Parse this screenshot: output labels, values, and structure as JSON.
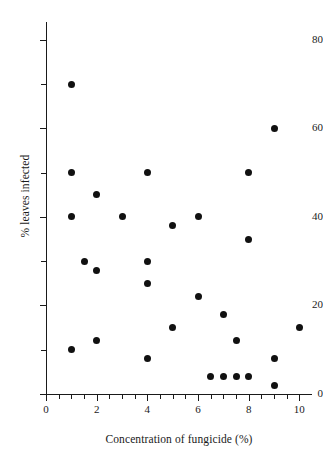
{
  "chart_data": {
    "type": "scatter",
    "title": "",
    "xlabel": "Concentration of fungicide (%)",
    "ylabel": "% leaves infected",
    "xlim": [
      0,
      10.5
    ],
    "ylim": [
      0,
      84
    ],
    "grid": false,
    "legend": null,
    "x_ticks": [
      0,
      2,
      4,
      6,
      8,
      10
    ],
    "x_tick_labels": [
      "0",
      "2",
      "4",
      "6",
      "8",
      "10"
    ],
    "x_minor_tick_step": 0.5,
    "y_ticks": [
      0,
      20,
      40,
      60,
      80
    ],
    "y_tick_labels": [
      "0",
      "20",
      "40",
      "60",
      "80"
    ],
    "y_minor_tick_step": 10,
    "marker": "filled-circle",
    "marker_color": "#111111",
    "axis_color": "#1a1a1a",
    "background_color": "#ffffff",
    "points": [
      {
        "x": 1,
        "y": 70
      },
      {
        "x": 1,
        "y": 50
      },
      {
        "x": 1,
        "y": 40
      },
      {
        "x": 1,
        "y": 10
      },
      {
        "x": 1.5,
        "y": 30
      },
      {
        "x": 2,
        "y": 45
      },
      {
        "x": 2,
        "y": 28
      },
      {
        "x": 2,
        "y": 12
      },
      {
        "x": 3,
        "y": 40
      },
      {
        "x": 4,
        "y": 50
      },
      {
        "x": 4,
        "y": 30
      },
      {
        "x": 4,
        "y": 25
      },
      {
        "x": 4,
        "y": 8
      },
      {
        "x": 5,
        "y": 38
      },
      {
        "x": 5,
        "y": 15
      },
      {
        "x": 6,
        "y": 40
      },
      {
        "x": 6,
        "y": 22
      },
      {
        "x": 6.5,
        "y": 4
      },
      {
        "x": 7,
        "y": 18
      },
      {
        "x": 7,
        "y": 4
      },
      {
        "x": 7.5,
        "y": 12
      },
      {
        "x": 7.5,
        "y": 4
      },
      {
        "x": 8,
        "y": 50
      },
      {
        "x": 8,
        "y": 35
      },
      {
        "x": 8,
        "y": 4
      },
      {
        "x": 9,
        "y": 60
      },
      {
        "x": 9,
        "y": 8
      },
      {
        "x": 9,
        "y": 2
      },
      {
        "x": 10,
        "y": 15
      }
    ]
  }
}
